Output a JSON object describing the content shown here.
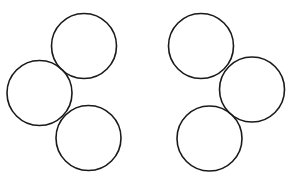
{
  "diagram": {
    "stroke_color": "#1a1a1a",
    "background": "#ffffff",
    "groups": [
      {
        "name": "left-group",
        "circles": [
          {
            "name": "top"
          },
          {
            "name": "middle-left"
          },
          {
            "name": "bottom"
          }
        ]
      },
      {
        "name": "right-group",
        "circles": [
          {
            "name": "top"
          },
          {
            "name": "middle-right"
          },
          {
            "name": "bottom"
          }
        ]
      }
    ]
  }
}
